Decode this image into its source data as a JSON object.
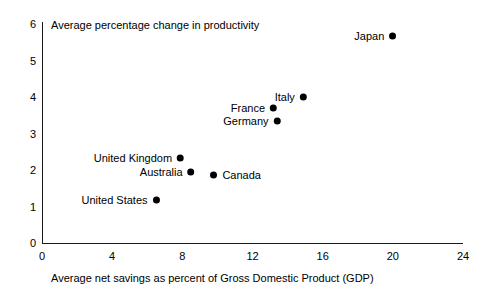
{
  "chart_data": {
    "type": "scatter",
    "title": "Average percentage change in productivity",
    "xlabel": "Average net savings as percent of Gross Domestic Product (GDP)",
    "ylabel": "",
    "xlim": [
      0,
      24
    ],
    "ylim": [
      0,
      6
    ],
    "xticks": [
      0,
      4,
      8,
      12,
      16,
      20,
      24
    ],
    "yticks": [
      0,
      1,
      2,
      3,
      4,
      5,
      6
    ],
    "xtick_labels": [
      "0",
      "4",
      "8",
      "12",
      "16",
      "20",
      "24"
    ],
    "ytick_labels": [
      "0",
      "1",
      "2",
      "3",
      "4",
      "5",
      "6"
    ],
    "grid": false,
    "legend": false,
    "marker_color": "#000000",
    "axis_color": "#1a1a1a",
    "points": [
      {
        "label": "Japan",
        "x": 20.0,
        "y": 5.67,
        "label_pos": "left"
      },
      {
        "label": "Italy",
        "x": 14.9,
        "y": 4.0,
        "label_pos": "left"
      },
      {
        "label": "France",
        "x": 13.2,
        "y": 3.7,
        "label_pos": "left"
      },
      {
        "label": "Germany",
        "x": 13.4,
        "y": 3.35,
        "label_pos": "left"
      },
      {
        "label": "United Kingdom",
        "x": 7.9,
        "y": 2.33,
        "label_pos": "left"
      },
      {
        "label": "Australia",
        "x": 8.5,
        "y": 1.95,
        "label_pos": "left"
      },
      {
        "label": "Canada",
        "x": 9.8,
        "y": 1.85,
        "label_pos": "right"
      },
      {
        "label": "United States",
        "x": 6.5,
        "y": 1.18,
        "label_pos": "left"
      }
    ]
  }
}
